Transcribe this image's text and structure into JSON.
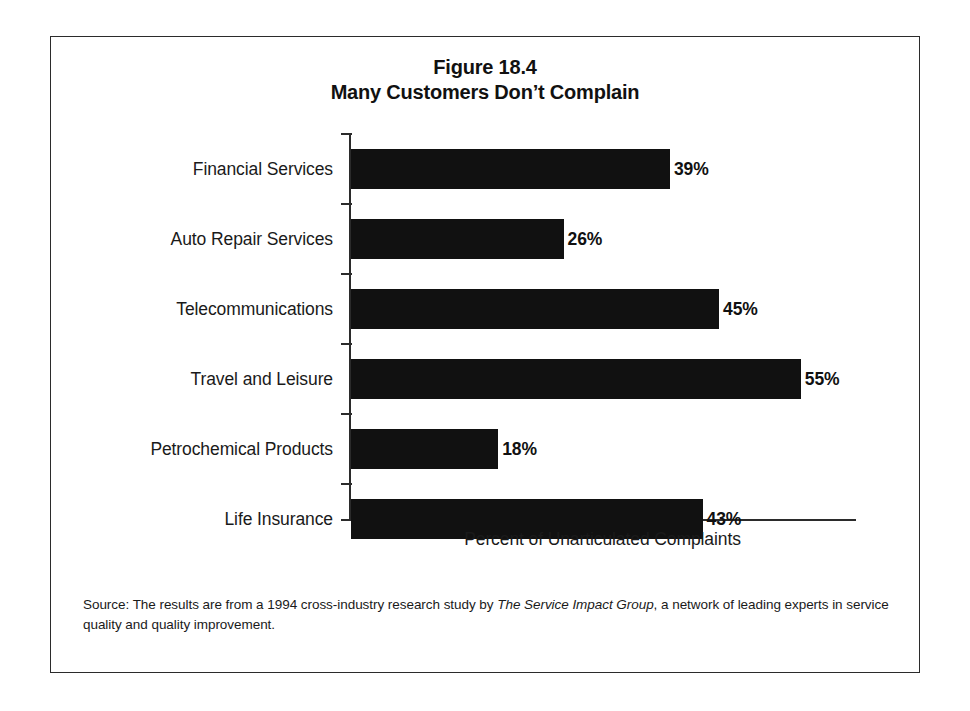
{
  "figure": {
    "title_line1": "Figure 18.4",
    "title_line2": "Many Customers Don’t Complain",
    "source_prefix": "Source: The results are from a 1994 cross-industry research study by ",
    "source_italic": "The Service Impact Group",
    "source_suffix": ", a network of leading experts in service quality and quality improvement."
  },
  "chart_data": {
    "type": "bar",
    "orientation": "horizontal",
    "xlabel": "Percent of Unarticulated Complaints",
    "ylabel": "",
    "xlim": [
      0,
      62
    ],
    "grid": false,
    "legend": false,
    "bar_color": "#111111",
    "axis_color": "#2b2b2b",
    "value_suffix": "%",
    "categories": [
      "Financial Services",
      "Auto Repair Services",
      "Telecommunications",
      "Travel and Leisure",
      "Petrochemical Products",
      "Life Insurance"
    ],
    "values": [
      39,
      26,
      45,
      55,
      18,
      43
    ],
    "labels": [
      "39%",
      "26%",
      "45%",
      "55%",
      "18%",
      "43%"
    ]
  }
}
